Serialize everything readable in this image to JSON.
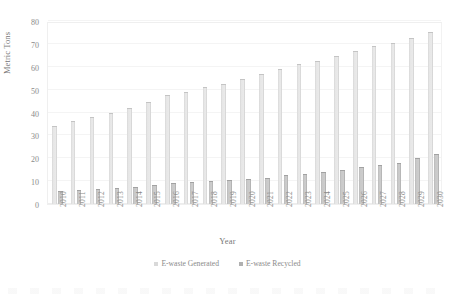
{
  "chart_data": {
    "type": "bar",
    "title": "",
    "xlabel": "Year",
    "ylabel": "Metric Tons",
    "ylim": [
      0,
      80
    ],
    "yticks": [
      0,
      10,
      20,
      30,
      40,
      50,
      60,
      70,
      80
    ],
    "grid": true,
    "legend_position": "bottom-center",
    "categories": [
      "2010",
      "2011",
      "2012",
      "2013",
      "2014",
      "2015",
      "2016",
      "2017",
      "2018",
      "2019",
      "2020",
      "2021",
      "2022",
      "2023",
      "2024",
      "2025",
      "2026",
      "2027",
      "2028",
      "2029",
      "2030"
    ],
    "series": [
      {
        "name": "E-waste Generated",
        "color": "#d9d9d9",
        "values": [
          34,
          36.5,
          38,
          40,
          42,
          44.5,
          47.5,
          49,
          51,
          52.5,
          54.5,
          57,
          59,
          61,
          62.5,
          64.5,
          67,
          69,
          70.5,
          72.5,
          75
        ]
      },
      {
        "name": "E-waste Recycled",
        "color": "#b0b0b0",
        "values": [
          5.5,
          6,
          6.5,
          7,
          7.5,
          8.5,
          9,
          9.5,
          10,
          10.5,
          11,
          11.5,
          12.5,
          13,
          14,
          15,
          16,
          17,
          18,
          20,
          22
        ]
      }
    ]
  },
  "axes": {
    "y_title": "Metric Tons",
    "x_title": "Year"
  },
  "legend": {
    "items": [
      {
        "label": "E-waste Generated",
        "swatch": "generated"
      },
      {
        "label": "E-waste Recycled",
        "swatch": "recycled"
      }
    ]
  }
}
